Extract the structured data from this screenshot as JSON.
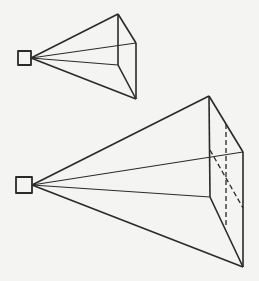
{
  "diagram": {
    "background": "#f4f4f2",
    "stroke": "#2a2a2a",
    "small": {
      "eye_box": {
        "x": 18,
        "y": 51,
        "w": 13,
        "h": 14
      },
      "apex": [
        31,
        58
      ],
      "vertices": {
        "top": [
          118,
          14
        ],
        "right": [
          136,
          43
        ],
        "bottom": [
          136,
          99
        ],
        "inner": [
          118,
          65
        ]
      }
    },
    "large": {
      "eye_box": {
        "x": 16,
        "y": 177,
        "w": 16,
        "h": 16
      },
      "apex": [
        32,
        185
      ],
      "vertices": {
        "top": [
          209,
          96
        ],
        "right": [
          243,
          152
        ],
        "bottom": [
          243,
          267
        ],
        "inner": [
          210,
          197
        ]
      },
      "hidden_edges": [
        {
          "from": [
            226,
            124
          ],
          "to": [
            226,
            226
          ]
        },
        {
          "from": [
            210,
            150
          ],
          "to": [
            243,
            208
          ]
        }
      ]
    }
  }
}
